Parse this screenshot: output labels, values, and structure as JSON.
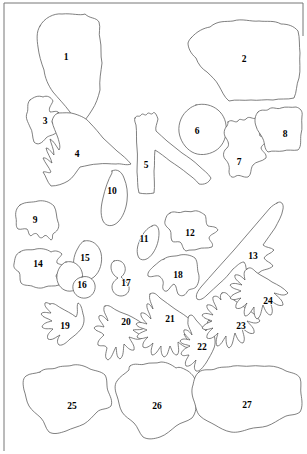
{
  "figure": {
    "type": "line-drawing-plate",
    "background_color": "#ffffff",
    "outline_color": "#2b2b2b",
    "label_color": "#000000",
    "width": 307,
    "height": 454,
    "frame": {
      "top_line": "M 4 3 L 303 3",
      "left_line": "M 4 3 L 4 451",
      "right_line": "M 303 3 L 303 36"
    }
  },
  "labels": [
    {
      "id": "1",
      "text": "1",
      "x": 66,
      "y": 58
    },
    {
      "id": "2",
      "text": "2",
      "x": 244,
      "y": 60
    },
    {
      "id": "3",
      "text": "3",
      "x": 45,
      "y": 122
    },
    {
      "id": "4",
      "text": "4",
      "x": 77,
      "y": 155
    },
    {
      "id": "5",
      "text": "5",
      "x": 146,
      "y": 166
    },
    {
      "id": "6",
      "text": "6",
      "x": 197,
      "y": 132
    },
    {
      "id": "7",
      "text": "7",
      "x": 239,
      "y": 163
    },
    {
      "id": "8",
      "text": "8",
      "x": 285,
      "y": 135
    },
    {
      "id": "9",
      "text": "9",
      "x": 35,
      "y": 221
    },
    {
      "id": "10",
      "text": "10",
      "x": 112,
      "y": 192
    },
    {
      "id": "11",
      "text": "11",
      "x": 144,
      "y": 240
    },
    {
      "id": "12",
      "text": "12",
      "x": 190,
      "y": 234
    },
    {
      "id": "13",
      "text": "13",
      "x": 253,
      "y": 257
    },
    {
      "id": "14",
      "text": "14",
      "x": 38,
      "y": 265
    },
    {
      "id": "15",
      "text": "15",
      "x": 85,
      "y": 259
    },
    {
      "id": "16",
      "text": "16",
      "x": 82,
      "y": 286
    },
    {
      "id": "17",
      "text": "17",
      "x": 126,
      "y": 284
    },
    {
      "id": "18",
      "text": "18",
      "x": 178,
      "y": 276
    },
    {
      "id": "19",
      "text": "19",
      "x": 65,
      "y": 327
    },
    {
      "id": "20",
      "text": "20",
      "x": 126,
      "y": 323
    },
    {
      "id": "21",
      "text": "21",
      "x": 170,
      "y": 320
    },
    {
      "id": "22",
      "text": "22",
      "x": 202,
      "y": 348
    },
    {
      "id": "23",
      "text": "23",
      "x": 241,
      "y": 327
    },
    {
      "id": "24",
      "text": "24",
      "x": 268,
      "y": 302
    },
    {
      "id": "25",
      "text": "25",
      "x": 72,
      "y": 407
    },
    {
      "id": "26",
      "text": "26",
      "x": 157,
      "y": 407
    },
    {
      "id": "27",
      "text": "27",
      "x": 247,
      "y": 406
    }
  ],
  "shapes": [
    {
      "id": "shape-1",
      "label": "1",
      "style": "outline-thin",
      "d": "M 40 26 C 44 18 54 13 62 14 C 72 13 80 16 85 14 C 90 19 96 17 99 22 C 101 28 98 33 100 39 C 102 47 100 55 102 63 C 101 72 99 80 100 90 C 98 98 96 104 92 110 C 88 117 83 122 79 128 C 75 124 73 117 70 112 C 64 104 58 98 53 92 C 48 85 45 78 44 70 C 41 62 39 55 38 47 C 37 40 36 32 40 26 Z"
    },
    {
      "id": "shape-2",
      "label": "2",
      "style": "outline-thin",
      "d": "M 191 38 C 197 31 204 28 210 27 C 218 20 226 22 233 21 C 242 18 251 22 259 21 C 267 22 274 20 281 24 C 288 24 294 26 298 31 C 300 38 299 46 300 53 C 299 61 301 70 299 78 C 296 85 297 92 294 98 C 287 100 280 98 273 100 C 265 99 258 101 251 100 C 243 101 236 99 229 101 C 224 97 222 91 219 86 C 216 80 211 76 207 72 C 202 69 198 64 196 58 C 191 54 188 48 188 43 C 189 40 190 39 191 38 Z"
    },
    {
      "id": "shape-3",
      "label": "3",
      "style": "outline-thin",
      "d": "M 30 100 C 34 97 38 95 43 97 C 47 95 51 97 53 101 C 51 106 48 108 50 112 C 54 112 57 110 59 113 C 57 117 53 118 52 122 C 54 126 58 127 57 132 C 53 136 49 135 46 138 C 42 143 38 146 34 142 C 32 137 33 131 30 127 C 28 122 25 118 27 113 C 29 109 26 104 30 100 Z"
    },
    {
      "id": "shape-4",
      "label": "4",
      "style": "outline-thin",
      "d": "M 58 113 C 64 113 70 112 75 114 C 81 116 86 118 90 123 C 95 128 99 133 103 138 C 108 142 112 147 117 151 C 122 155 127 159 131 164 C 126 166 121 163 116 164 C 110 164 104 163 98 164 C 92 164 86 166 80 167 C 76 172 73 178 68 181 C 63 184 57 186 51 186 C 47 182 46 176 43 172 C 46 171 49 174 51 172 C 49 167 45 163 43 158 C 46 157 49 161 52 163 C 51 158 47 153 46 148 C 49 148 51 152 54 155 C 54 149 51 144 50 139 C 54 141 56 146 59 150 C 61 147 59 142 58 138 C 56 132 53 127 52 121 C 53 117 55 114 58 113 Z"
    },
    {
      "id": "shape-5",
      "label": "5",
      "style": "outline-thin",
      "d": "M 135 118 C 137 114 139 118 141 115 C 143 112 145 117 147 114 C 149 111 151 116 153 113 C 155 111 157 116 158 119 C 157 124 155 127 156 131 C 160 134 163 138 167 141 C 172 145 177 149 182 153 C 188 157 194 161 199 166 C 203 170 208 173 211 178 C 209 183 204 185 199 184 C 196 180 192 177 188 174 C 182 169 176 165 170 161 C 165 157 160 153 155 150 C 154 157 155 164 154 171 C 154 178 155 186 154 193 C 149 194 144 194 139 193 C 137 186 138 179 137 172 C 137 164 138 156 137 148 C 136 140 137 132 136 125 C 135 122 134 120 135 118 Z"
    },
    {
      "id": "shape-6",
      "label": "6",
      "style": "outline-thin",
      "d": "M 196 105 C 204 103 212 105 218 110 C 224 115 227 123 226 131 C 226 139 222 147 215 151 C 208 155 199 156 192 152 C 185 148 180 140 179 132 C 178 123 182 114 189 109 C 191 107 194 106 196 105 Z"
    },
    {
      "id": "shape-7",
      "label": "7",
      "style": "outline-thin",
      "d": "M 228 122 C 232 118 235 124 238 121 C 240 117 243 122 246 119 C 249 115 253 120 256 118 C 260 116 262 121 263 125 C 262 130 258 132 260 136 C 264 137 268 135 270 139 C 267 143 262 144 261 148 C 262 152 267 153 266 158 C 262 162 256 161 253 165 C 250 169 252 174 248 177 C 243 178 240 174 236 176 C 232 179 229 176 229 171 C 230 166 228 162 225 159 C 222 155 224 150 227 148 C 230 145 228 141 226 138 C 223 134 224 129 227 126 C 228 124 228 123 228 122 Z"
    },
    {
      "id": "shape-8",
      "label": "8",
      "style": "outline-thin",
      "d": "M 258 112 C 262 108 266 112 269 109 C 273 106 277 110 281 108 C 286 106 291 108 296 107 C 300 108 303 111 302 116 C 301 122 303 128 301 134 C 300 140 302 146 298 150 C 293 151 288 149 283 151 C 278 152 273 150 268 152 C 264 149 265 143 263 139 C 261 134 257 131 256 126 C 254 121 255 115 258 112 Z"
    },
    {
      "id": "shape-9",
      "label": "9",
      "style": "outline-thin",
      "d": "M 20 205 C 26 201 32 203 38 201 C 44 200 50 202 54 206 C 57 211 56 217 58 222 C 60 226 58 231 54 233 C 51 235 54 239 51 240 C 48 238 47 234 44 236 C 42 239 39 238 38 235 C 36 232 33 234 31 236 C 28 235 29 231 27 229 C 24 228 21 230 18 229 C 15 226 17 222 16 218 C 15 213 16 208 20 205 Z"
    },
    {
      "id": "shape-10",
      "label": "10",
      "style": "outline-thin",
      "d": "M 112 171 C 117 168 122 172 124 178 C 127 185 128 193 127 201 C 126 209 123 217 118 222 C 113 227 106 227 103 221 C 100 214 101 206 103 198 C 105 189 108 180 112 173 C 112 172 112 171 112 171 Z"
    },
    {
      "id": "shape-11",
      "label": "11",
      "style": "outline-thin",
      "d": "M 152 226 C 156 223 159 227 159 233 C 159 240 157 247 153 253 C 149 259 143 262 139 258 C 136 253 137 246 140 240 C 143 233 147 228 152 226 Z"
    },
    {
      "id": "shape-12",
      "label": "12",
      "style": "outline-thin",
      "d": "M 170 213 C 174 210 178 214 182 212 C 186 210 190 213 194 211 C 198 210 202 213 205 215 C 207 219 205 223 208 226 C 212 227 216 226 218 230 C 215 234 210 234 209 238 C 210 242 214 243 212 247 C 207 249 202 247 198 249 C 194 251 190 249 186 251 C 182 249 183 244 180 242 C 177 241 174 243 172 241 C 170 237 172 233 170 230 C 167 227 164 225 165 221 C 166 217 167 214 170 213 Z"
    },
    {
      "id": "shape-13",
      "label": "13",
      "style": "outline-thin",
      "d": "M 277 203 C 281 200 284 204 283 209 C 282 216 278 222 275 228 C 271 234 267 239 263 245 C 266 248 271 247 274 250 C 271 254 266 254 264 258 C 266 262 271 262 273 266 C 269 270 263 269 260 272 C 256 275 252 277 248 274 C 245 270 247 265 244 262 C 240 262 237 266 233 269 C 229 274 225 279 220 283 C 216 287 211 291 207 295 C 204 298 200 301 197 299 C 195 295 198 291 201 287 C 206 281 211 276 216 270 C 222 263 228 257 234 250 C 240 243 246 236 252 229 C 258 222 264 215 270 208 C 272 206 275 204 277 203 Z"
    },
    {
      "id": "shape-14",
      "label": "14",
      "style": "outline-thin",
      "d": "M 20 252 C 25 248 31 251 36 249 C 41 248 47 249 51 252 C 55 250 59 251 62 254 C 60 258 56 259 57 263 C 60 265 64 264 65 268 C 62 272 57 272 56 276 C 57 280 61 281 59 285 C 54 287 49 285 45 287 C 41 289 36 288 32 286 C 28 285 24 286 21 283 C 19 279 21 275 19 272 C 16 270 13 268 14 264 C 15 259 15 254 20 252 Z"
    },
    {
      "id": "shape-15",
      "label": "15",
      "style": "outline-thin",
      "d": "M 84 241 C 92 239 99 245 101 253 C 103 262 100 272 94 277 C 88 282 80 280 76 273 C 72 266 73 256 78 248 C 80 244 82 242 84 241 Z"
    },
    {
      "id": "shape-16",
      "label": "16",
      "style": "outline-thin",
      "d": "M 66 262 C 73 260 80 265 82 272 C 84 279 81 287 75 290 C 68 293 61 290 58 283 C 55 276 58 267 64 263 C 65 262 66 262 66 262 Z"
    },
    {
      "id": "shape-16b",
      "label": "16-circle",
      "style": "outline-thin",
      "d": "M 82 277 C 88 275 94 279 95 285 C 96 291 92 297 86 298 C 80 299 74 295 73 289 C 72 283 76 278 82 277 Z"
    },
    {
      "id": "shape-17",
      "label": "17",
      "style": "outline-thin",
      "d": "M 114 261 C 119 259 124 262 125 267 C 126 271 124 275 121 277 C 124 280 128 282 129 287 C 130 292 126 296 121 296 C 116 296 112 292 112 287 C 112 283 115 280 118 278 C 114 276 111 272 111 267 C 111 264 112 262 114 261 Z"
    },
    {
      "id": "shape-18",
      "label": "18",
      "style": "outline-thin",
      "d": "M 164 259 C 169 255 175 257 180 255 C 185 254 191 255 195 258 C 198 262 197 267 198 272 C 200 277 199 283 196 287 C 193 290 189 288 187 292 C 185 296 181 297 178 294 C 176 290 177 286 174 284 C 171 285 170 289 167 291 C 164 292 162 289 163 285 C 164 281 162 278 159 276 C 155 275 151 278 148 276 C 147 272 151 269 154 266 C 158 263 160 260 164 259 Z"
    },
    {
      "id": "shape-19",
      "label": "19",
      "style": "outline-thin",
      "d": "M 50 304 C 54 302 57 306 61 308 C 66 311 71 313 76 317 C 79 312 76 307 78 303 C 81 304 82 309 83 314 C 85 319 84 325 81 329 C 78 333 74 336 70 339 C 67 342 63 346 59 345 C 56 342 58 338 60 335 C 56 337 52 341 48 339 C 46 335 50 332 53 329 C 49 328 45 330 42 327 C 43 323 48 322 52 321 C 48 318 43 318 41 314 C 43 311 47 313 51 313 C 48 309 44 307 45 303 C 46 302 48 303 50 304 Z"
    },
    {
      "id": "shape-20",
      "label": "20",
      "style": "outline-thin",
      "d": "M 105 306 C 109 304 112 308 116 310 C 121 313 127 314 132 317 C 137 320 142 322 145 327 C 142 331 137 329 133 330 C 136 333 141 334 142 338 C 138 341 133 338 129 337 C 131 342 135 345 134 350 C 130 351 127 347 124 344 C 123 350 124 356 120 359 C 116 357 117 352 116 347 C 113 352 112 358 108 360 C 104 358 106 353 107 348 C 105 344 101 347 98 345 C 97 341 101 338 104 335 C 101 331 96 332 94 328 C 96 325 100 326 104 327 C 102 322 98 320 99 316 C 102 314 105 318 108 321 C 107 316 103 312 104 308 C 104 307 104 306 105 306 Z"
    },
    {
      "id": "shape-21",
      "label": "21",
      "style": "outline-thin",
      "d": "M 150 294 C 154 291 157 295 160 298 C 165 302 170 305 175 309 C 181 313 187 316 191 321 C 195 325 199 330 197 335 C 193 338 188 335 184 334 C 186 339 191 342 190 347 C 186 349 182 345 178 342 C 178 347 180 352 177 355 C 173 355 172 350 170 346 C 168 351 168 356 164 357 C 161 355 161 350 161 346 C 158 350 156 355 152 355 C 150 351 152 347 153 343 C 150 346 146 349 143 347 C 142 343 145 340 148 337 C 144 338 140 340 137 337 C 138 333 143 332 147 330 C 143 328 138 328 136 324 C 139 321 143 323 147 324 C 144 320 140 317 141 313 C 145 312 148 316 151 319 C 150 313 146 309 147 304 C 149 303 151 306 153 309 C 152 304 148 299 150 294 Z"
    },
    {
      "id": "shape-22",
      "label": "22",
      "style": "outline-thin",
      "d": "M 189 316 C 192 313 194 317 196 320 C 199 324 203 327 206 331 C 208 327 206 322 209 320 C 212 322 212 327 213 332 C 215 337 216 343 214 348 C 212 353 209 358 206 363 C 203 367 200 372 196 371 C 193 368 195 364 196 360 C 193 363 190 367 186 366 C 184 362 187 359 189 355 C 186 355 183 357 181 354 C 182 350 186 348 190 346 C 186 344 182 345 180 341 C 182 338 186 339 190 340 C 187 336 183 334 184 330 C 187 329 190 332 192 335 C 191 330 187 326 188 321 C 188 319 188 317 189 316 Z"
    },
    {
      "id": "shape-23",
      "label": "23",
      "style": "outline-thin",
      "d": "M 222 293 C 226 291 228 295 231 298 C 236 302 242 305 247 309 C 252 312 257 316 260 321 C 256 325 251 322 247 321 C 250 325 255 328 254 333 C 250 335 246 331 242 328 C 243 334 246 339 243 343 C 239 343 237 338 235 333 C 233 339 233 346 229 348 C 226 346 226 341 226 336 C 223 340 221 346 217 346 C 215 342 217 337 218 333 C 215 336 211 340 207 338 C 206 334 210 331 213 328 C 209 329 205 331 202 328 C 204 324 208 323 212 321 C 208 319 204 319 202 315 C 205 312 209 314 213 315 C 210 311 206 309 207 305 C 211 304 214 307 217 310 C 216 305 212 301 213 297 C 216 295 219 297 221 300 C 220 297 220 294 222 293 Z"
    },
    {
      "id": "shape-24",
      "label": "24",
      "style": "outline-thin",
      "d": "M 247 269 C 250 266 253 269 256 272 C 261 276 267 278 272 282 C 278 285 284 288 288 293 C 284 297 279 294 274 293 C 278 297 283 300 283 305 C 279 307 274 303 270 300 C 271 306 274 311 271 315 C 267 315 265 310 263 305 C 261 311 261 317 257 319 C 254 317 254 312 254 307 C 251 311 249 316 245 316 C 243 312 245 307 247 303 C 244 306 240 310 236 308 C 235 304 238 301 241 298 C 237 299 233 301 230 298 C 232 294 237 293 241 291 C 237 289 232 289 230 285 C 233 282 238 284 242 285 C 238 281 234 279 235 275 C 239 274 242 277 245 280 C 244 275 243 271 247 269 Z"
    },
    {
      "id": "shape-25",
      "label": "25",
      "style": "outline-thin",
      "d": "M 40 372 C 45 367 51 370 56 368 C 62 365 68 367 73 365 C 79 364 85 366 90 369 C 95 371 101 371 105 375 C 108 380 106 386 108 391 C 110 396 113 401 111 406 C 107 410 101 408 97 412 C 93 416 89 421 84 424 C 78 427 72 428 66 431 C 60 433 54 435 49 432 C 45 428 45 422 41 418 C 37 414 32 411 29 406 C 26 401 26 395 24 390 C 23 385 22 379 26 376 C 30 373 35 374 40 372 Z"
    },
    {
      "id": "shape-26",
      "label": "26",
      "style": "outline-thin",
      "d": "M 130 366 C 135 362 140 366 145 364 C 150 362 156 364 161 362 C 167 362 172 365 176 368 C 180 366 184 369 188 371 C 192 374 196 378 195 383 C 194 389 193 395 195 400 C 197 406 196 413 192 418 C 187 422 181 422 176 426 C 171 430 166 435 160 437 C 154 439 148 440 143 437 C 139 433 138 427 134 423 C 130 419 125 417 122 412 C 119 407 119 401 117 396 C 115 391 114 385 117 381 C 120 376 125 374 129 370 C 129 368 129 367 130 366 Z"
    },
    {
      "id": "shape-27",
      "label": "27",
      "style": "outline-thin",
      "d": "M 199 372 C 204 368 210 371 215 369 C 221 366 227 368 233 366 C 239 365 245 367 251 366 C 257 365 263 367 269 366 C 275 366 281 368 286 371 C 291 373 297 373 300 378 C 302 383 300 389 301 394 C 302 400 303 407 300 412 C 295 416 289 414 284 417 C 278 420 273 424 267 426 C 261 428 255 427 249 429 C 243 431 237 433 231 432 C 225 431 220 428 215 425 C 210 422 204 420 200 416 C 196 412 196 406 194 401 C 192 396 191 390 193 385 C 194 380 195 375 199 372 Z"
    }
  ]
}
